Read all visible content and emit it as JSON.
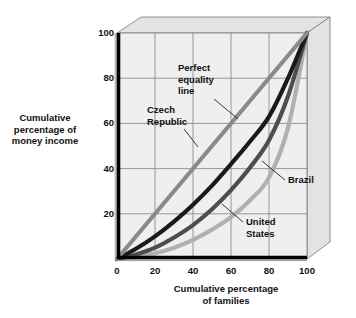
{
  "chart_data": {
    "type": "line",
    "title": "",
    "xlabel": "Cumulative percentage\nof families",
    "ylabel": "Cumulative\npercentage of\nmoney income",
    "xlim": [
      0,
      100
    ],
    "ylim": [
      0,
      100
    ],
    "xticks": [
      "0",
      "20",
      "40",
      "60",
      "80",
      "100"
    ],
    "yticks": [
      "20",
      "40",
      "60",
      "80",
      "100"
    ],
    "xtick_values": [
      0,
      20,
      40,
      60,
      80,
      100
    ],
    "ytick_values": [
      20,
      40,
      60,
      80,
      100
    ],
    "grid": true,
    "legend": "annotations",
    "series": [
      {
        "name": "Perfect equality line",
        "color": "#8a8a8a",
        "x": [
          0,
          20,
          40,
          60,
          80,
          100
        ],
        "values": [
          0,
          20,
          40,
          60,
          80,
          100
        ]
      },
      {
        "name": "Czech Republic",
        "color": "#1a1a1a",
        "x": [
          0,
          10,
          20,
          30,
          40,
          50,
          60,
          70,
          80,
          90,
          100
        ],
        "values": [
          0,
          4.5,
          10,
          16.5,
          24,
          32.5,
          42,
          52,
          63,
          80,
          100
        ]
      },
      {
        "name": "United States",
        "color": "#4d4d4d",
        "x": [
          0,
          10,
          20,
          30,
          40,
          50,
          60,
          70,
          80,
          90,
          100
        ],
        "values": [
          0,
          2,
          5,
          9.5,
          15,
          22,
          30.5,
          40.5,
          52.5,
          72,
          100
        ]
      },
      {
        "name": "Brazil",
        "color": "#b0b0b0",
        "x": [
          0,
          10,
          20,
          30,
          40,
          50,
          60,
          70,
          80,
          90,
          100
        ],
        "values": [
          0,
          1,
          2.5,
          5,
          8.5,
          13,
          18.5,
          26,
          36,
          58,
          100
        ]
      }
    ],
    "annotations": [
      {
        "name": "perfect-equality-line",
        "text": "Perfect\nequality\nline"
      },
      {
        "name": "czech-republic",
        "text": "Czech\nRepublic"
      },
      {
        "name": "united-states",
        "text": "United\nStates"
      },
      {
        "name": "brazil",
        "text": "Brazil"
      }
    ]
  },
  "axes": {
    "y_title": "Cumulative\npercentage of\nmoney income",
    "x_title": "Cumulative percentage\nof families",
    "x_tick_0": "0",
    "x_tick_20": "20",
    "x_tick_40": "40",
    "x_tick_60": "60",
    "x_tick_80": "80",
    "x_tick_100": "100",
    "y_tick_20": "20",
    "y_tick_40": "40",
    "y_tick_60": "60",
    "y_tick_80": "80",
    "y_tick_100": "100"
  },
  "labels": {
    "perfect_equality": "Perfect\nequality\nline",
    "czech_republic": "Czech\nRepublic",
    "united_states": "United\nStates",
    "brazil": "Brazil"
  },
  "colors": {
    "panel": "#eeeeee",
    "top_face": "#e2e2e2",
    "right_face": "#e2e2e2",
    "grid": "#8f8f8f",
    "axis": "#000000",
    "equality": "#8a8a8a",
    "czech": "#1a1a1a",
    "usa": "#4d4d4d",
    "brazil": "#b0b0b0"
  }
}
